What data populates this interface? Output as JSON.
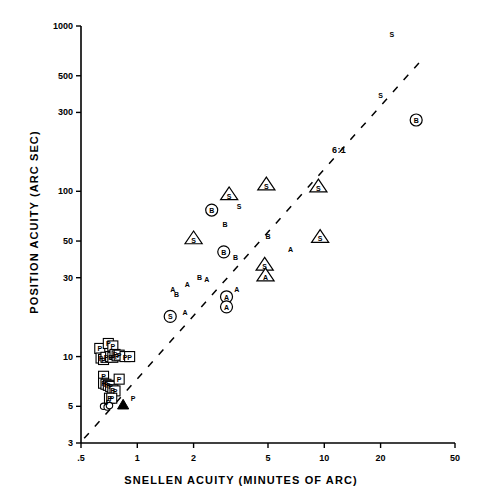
{
  "chart_data": {
    "type": "scatter",
    "title": "",
    "xlabel": "SNELLEN ACUITY (MINUTES OF ARC)",
    "ylabel": "POSITION ACUITY (ARC SEC)",
    "xscale": "log",
    "yscale": "log",
    "xlim": [
      0.5,
      50
    ],
    "ylim": [
      3,
      1000
    ],
    "grid": false,
    "legend": "none",
    "xticks": [
      {
        "value": 0.5,
        "label": ".5"
      },
      {
        "value": 1,
        "label": "1"
      },
      {
        "value": 2,
        "label": "2"
      },
      {
        "value": 5,
        "label": "5"
      },
      {
        "value": 10,
        "label": "10"
      },
      {
        "value": 20,
        "label": "20"
      },
      {
        "value": 50,
        "label": "50"
      }
    ],
    "yticks": [
      {
        "value": 3,
        "label": "3"
      },
      {
        "value": 5,
        "label": "5"
      },
      {
        "value": 10,
        "label": "10"
      },
      {
        "value": 30,
        "label": "30"
      },
      {
        "value": 50,
        "label": "50"
      },
      {
        "value": 100,
        "label": "100"
      },
      {
        "value": 300,
        "label": "300"
      },
      {
        "value": 500,
        "label": "500"
      },
      {
        "value": 1000,
        "label": "1000"
      }
    ],
    "annotations": [
      {
        "text": "6:1",
        "x": 11.0,
        "y": 175,
        "note": "slope reference label beside dashed line"
      }
    ],
    "reference_line": {
      "style": "dashed",
      "label": "6:1",
      "x_start": 0.52,
      "y_start": 3.2,
      "x_end": 33.0,
      "y_end": 620
    },
    "series": [
      {
        "name": "P (square outline)",
        "symbol": "square-letter",
        "letter": "P",
        "points": [
          [
            0.63,
            11.2
          ],
          [
            0.7,
            12.0
          ],
          [
            0.74,
            11.6
          ],
          [
            0.64,
            9.8
          ],
          [
            0.66,
            9.6
          ],
          [
            0.68,
            9.9
          ],
          [
            0.72,
            10.0
          ],
          [
            0.74,
            9.9
          ],
          [
            0.76,
            10.3
          ],
          [
            0.78,
            10.1
          ],
          [
            0.8,
            10.2
          ],
          [
            0.86,
            10.0
          ],
          [
            0.91,
            10.0
          ],
          [
            0.66,
            7.6
          ],
          [
            0.66,
            6.9
          ],
          [
            0.68,
            6.8
          ],
          [
            0.7,
            6.7
          ],
          [
            0.72,
            6.6
          ],
          [
            0.74,
            6.3
          ],
          [
            0.76,
            6.2
          ],
          [
            0.8,
            7.3
          ],
          [
            0.71,
            5.6
          ],
          [
            0.73,
            5.6
          ]
        ]
      },
      {
        "name": "P (plain letter)",
        "symbol": "plain-letter",
        "letter": "P",
        "points": [
          [
            0.7,
            5.3
          ],
          [
            0.95,
            5.6
          ]
        ]
      },
      {
        "name": "Open circles",
        "symbol": "open-circle",
        "letter": "",
        "points": [
          [
            0.66,
            5.0
          ],
          [
            0.69,
            4.95
          ],
          [
            0.71,
            5.05
          ]
        ]
      },
      {
        "name": "Filled triangle",
        "symbol": "filled-triangle",
        "letter": "",
        "points": [
          [
            0.84,
            5.1
          ]
        ]
      },
      {
        "name": "A (plain letter)",
        "symbol": "plain-letter",
        "letter": "A",
        "points": [
          [
            1.55,
            25.5
          ],
          [
            1.85,
            27.5
          ],
          [
            2.35,
            29.5
          ],
          [
            1.8,
            18.5
          ],
          [
            3.4,
            25.5
          ],
          [
            6.6,
            45.0
          ]
        ]
      },
      {
        "name": "B (plain letter)",
        "symbol": "plain-letter",
        "letter": "B",
        "points": [
          [
            1.62,
            24.0
          ],
          [
            2.15,
            30.5
          ],
          [
            2.95,
            63.0
          ],
          [
            3.35,
            40.0
          ],
          [
            5.0,
            54.0
          ]
        ]
      },
      {
        "name": "S (plain letter)",
        "symbol": "plain-letter",
        "letter": "S",
        "points": [
          [
            3.5,
            82.0
          ],
          [
            20.0,
            380.0
          ],
          [
            23.0,
            900.0
          ]
        ]
      },
      {
        "name": "A (circled)",
        "symbol": "circle-letter",
        "letter": "A",
        "points": [
          [
            3.0,
            23.0
          ],
          [
            3.0,
            20.0
          ]
        ]
      },
      {
        "name": "B (circled)",
        "symbol": "circle-letter",
        "letter": "B",
        "points": [
          [
            2.5,
            77.0
          ],
          [
            2.9,
            43.0
          ],
          [
            31.0,
            270.0
          ]
        ]
      },
      {
        "name": "S (circled)",
        "symbol": "circle-letter",
        "letter": "S",
        "points": [
          [
            1.5,
            17.5
          ]
        ]
      },
      {
        "name": "S (triangled)",
        "symbol": "triangle-letter",
        "letter": "S",
        "points": [
          [
            2.0,
            52.0
          ],
          [
            3.1,
            96.0
          ],
          [
            4.9,
            110.0
          ],
          [
            4.8,
            36.0
          ],
          [
            9.3,
            107.0
          ],
          [
            9.5,
            53.0
          ]
        ]
      },
      {
        "name": "A (triangled)",
        "symbol": "triangle-letter",
        "letter": "A",
        "points": [
          [
            4.85,
            31.0
          ]
        ]
      }
    ]
  },
  "axes": {
    "x_title": "SNELLEN ACUITY (MINUTES OF ARC)",
    "y_title": "POSITION ACUITY (ARC SEC)"
  },
  "slope_annotation": "6:1"
}
